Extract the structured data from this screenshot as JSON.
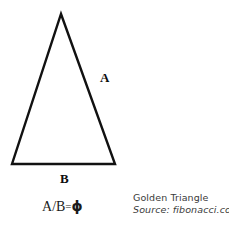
{
  "figure": {
    "background_color": "#ffffff",
    "stroke_color": "#111111",
    "width": 229,
    "height": 225
  },
  "diagram": {
    "shape_name": "isosceles-triangle",
    "vertices": {
      "apex": [
        61,
        14
      ],
      "bottom_left": [
        12,
        164
      ],
      "bottom_right": [
        115,
        164
      ]
    },
    "stroke_width": 2.4
  },
  "labels": {
    "side_a": "A",
    "side_b": "B"
  },
  "formula": {
    "numerator": "A",
    "slash": "/",
    "denominator": "B",
    "equals": "=",
    "result": "ϕ",
    "full_text": "A/B=ϕ"
  },
  "caption": {
    "title": "Golden Triangle",
    "source": "Source: fibonacci.com",
    "text_color": "#3a3a3a"
  }
}
